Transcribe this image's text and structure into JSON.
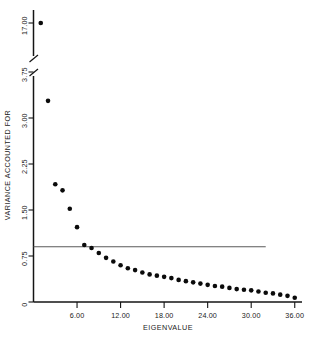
{
  "chart_data": {
    "type": "scatter",
    "title": "",
    "xlabel": "EIGENVALUE",
    "ylabel": "VARIANCE ACCOUNTED FOR",
    "x": [
      1,
      2,
      3,
      4,
      5,
      6,
      7,
      8,
      9,
      10,
      11,
      12,
      13,
      14,
      15,
      16,
      17,
      18,
      19,
      20,
      21,
      22,
      23,
      24,
      25,
      26,
      27,
      28,
      29,
      30,
      31,
      32,
      33,
      34,
      35,
      36
    ],
    "values": [
      17.0,
      3.28,
      1.92,
      1.82,
      1.52,
      1.22,
      0.93,
      0.88,
      0.8,
      0.72,
      0.66,
      0.6,
      0.55,
      0.52,
      0.48,
      0.45,
      0.43,
      0.41,
      0.39,
      0.36,
      0.34,
      0.32,
      0.3,
      0.28,
      0.26,
      0.25,
      0.23,
      0.21,
      0.2,
      0.19,
      0.17,
      0.15,
      0.14,
      0.12,
      0.1,
      0.07
    ],
    "xticks": [
      "6.00",
      "12.00",
      "18.00",
      "24.00",
      "30.00",
      "36.00"
    ],
    "xtick_values": [
      6,
      12,
      18,
      24,
      30,
      36
    ],
    "yticks": [
      "17.00",
      "3.75",
      "3.00",
      "2.25",
      "1.50",
      "0.75",
      "0"
    ],
    "ytick_values": [
      17.0,
      3.75,
      3.0,
      2.25,
      1.5,
      0.75,
      0
    ],
    "xlim": [
      0,
      37
    ],
    "ylim": [
      0,
      3.95
    ],
    "axis_break": true,
    "axis_break_note": "y-axis broken between 3.75 and 17.00",
    "grid": false,
    "legend": "none",
    "reference_line": {
      "y": 0.9,
      "x_start": 0,
      "x_end": 32,
      "label": ""
    },
    "marker": "filled-circle",
    "marker_color": "#0b0b0b"
  },
  "plot": {
    "xlabel": "EIGENVALUE",
    "ylabel": "VARIANCE ACCOUNTED FOR"
  }
}
